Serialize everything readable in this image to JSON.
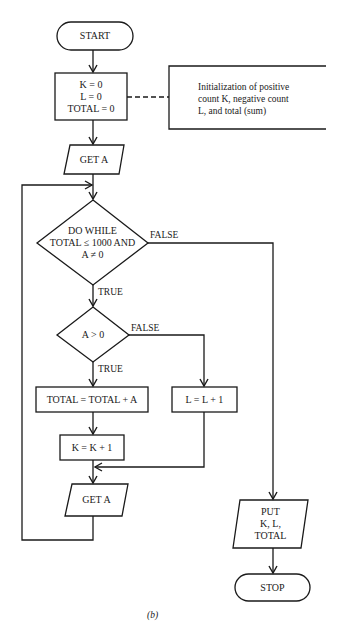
{
  "figure": {
    "caption": "(b)",
    "nodes": {
      "start": "START",
      "init": "K = 0\nL = 0\nTOTAL = 0",
      "get_a_1": "GET A",
      "do_while": "DO WHILE\nTOTAL ≤ 1000 AND\nA ≠ 0",
      "a_gt_0": "A > 0",
      "total_add": "TOTAL = TOTAL + A",
      "k_inc": "K = K + 1",
      "l_inc": "L = L + 1",
      "get_a_2": "GET A",
      "put": "PUT\nK, L,\nTOTAL",
      "stop": "STOP"
    },
    "annotation": "Initialization of positive\ncount K, negative count\nL, and total (sum)",
    "edge_labels": {
      "while_false": "FALSE",
      "while_true": "TRUE",
      "cond_false": "FALSE",
      "cond_true": "TRUE"
    },
    "line_color": "#1a1a1a"
  }
}
